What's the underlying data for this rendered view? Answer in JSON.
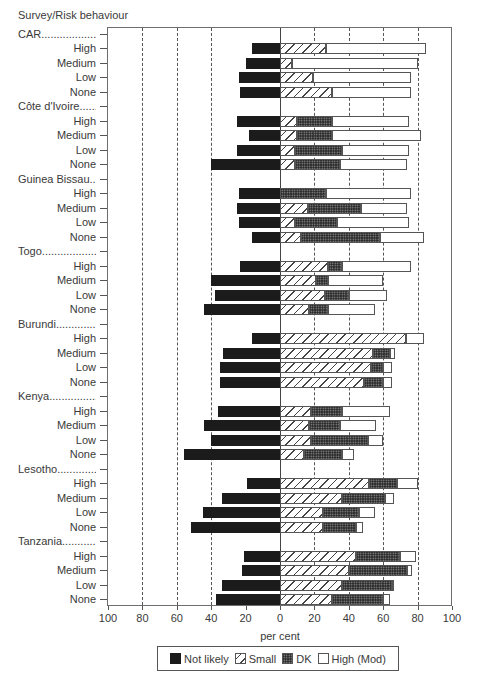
{
  "chart_data": {
    "type": "bar",
    "orientation": "horizontal-diverging-stacked",
    "title": "",
    "ylabel": "Survey/Risk behaviour",
    "xlabel": "per cent",
    "xlim": [
      -100,
      100
    ],
    "x_ticks": [
      "100",
      "80",
      "60",
      "40",
      "20",
      "0",
      "20",
      "40",
      "60",
      "80",
      "100"
    ],
    "grid": "vertical dashed at every 20",
    "legend_position": "bottom",
    "legend": [
      "Not likely",
      "Small",
      "DK",
      "High (Mod)"
    ],
    "note": "Not likely plotted to the left of zero; Small, DK and High (Mod) stacked to the right. Values are cumulative right-end positions converted to segment widths (per cent).",
    "groups": [
      {
        "survey": "CAR",
        "rows": [
          {
            "risk": "High",
            "not_likely": 16,
            "small": 27,
            "dk": 0,
            "high": 58
          },
          {
            "risk": "Medium",
            "not_likely": 20,
            "small": 7,
            "dk": 0,
            "high": 73
          },
          {
            "risk": "Low",
            "not_likely": 24,
            "small": 19,
            "dk": 0,
            "high": 57
          },
          {
            "risk": "None",
            "not_likely": 23,
            "small": 30,
            "dk": 0,
            "high": 46
          }
        ]
      },
      {
        "survey": "Côte d'Ivoire",
        "rows": [
          {
            "risk": "High",
            "not_likely": 25,
            "small": 10,
            "dk": 20,
            "high": 45
          },
          {
            "risk": "Medium",
            "not_likely": 18,
            "small": 10,
            "dk": 20,
            "high": 52
          },
          {
            "risk": "Low",
            "not_likely": 25,
            "small": 9,
            "dk": 27,
            "high": 39
          },
          {
            "risk": "None",
            "not_likely": 40,
            "small": 9,
            "dk": 26,
            "high": 39
          }
        ]
      },
      {
        "survey": "Guinea Bissau",
        "rows": [
          {
            "risk": "High",
            "not_likely": 24,
            "small": 0,
            "dk": 27,
            "high": 49
          },
          {
            "risk": "Medium",
            "not_likely": 25,
            "small": 16,
            "dk": 31,
            "high": 27
          },
          {
            "risk": "Low",
            "not_likely": 24,
            "small": 9,
            "dk": 24,
            "high": 42
          },
          {
            "risk": "None",
            "not_likely": 16,
            "small": 12,
            "dk": 46,
            "high": 26
          }
        ]
      },
      {
        "survey": "Togo",
        "rows": [
          {
            "risk": "High",
            "not_likely": 23,
            "small": 28,
            "dk": 8,
            "high": 40
          },
          {
            "risk": "Medium",
            "not_likely": 40,
            "small": 21,
            "dk": 7,
            "high": 32
          },
          {
            "risk": "Low",
            "not_likely": 38,
            "small": 26,
            "dk": 14,
            "high": 22
          },
          {
            "risk": "None",
            "not_likely": 44,
            "small": 17,
            "dk": 11,
            "high": 27
          }
        ]
      },
      {
        "survey": "Burundi",
        "rows": [
          {
            "risk": "High",
            "not_likely": 16,
            "small": 73,
            "dk": 0,
            "high": 11
          },
          {
            "risk": "Medium",
            "not_likely": 33,
            "small": 54,
            "dk": 10,
            "high": 3
          },
          {
            "risk": "Low",
            "not_likely": 35,
            "small": 53,
            "dk": 7,
            "high": 5
          },
          {
            "risk": "None",
            "not_likely": 35,
            "small": 49,
            "dk": 11,
            "high": 5
          }
        ]
      },
      {
        "survey": "Kenya",
        "rows": [
          {
            "risk": "High",
            "not_likely": 36,
            "small": 18,
            "dk": 18,
            "high": 28
          },
          {
            "risk": "Medium",
            "not_likely": 44,
            "small": 17,
            "dk": 18,
            "high": 21
          },
          {
            "risk": "Low",
            "not_likely": 40,
            "small": 18,
            "dk": 33,
            "high": 9
          },
          {
            "risk": "None",
            "not_likely": 56,
            "small": 14,
            "dk": 22,
            "high": 7
          }
        ]
      },
      {
        "survey": "Lesotho",
        "rows": [
          {
            "risk": "High",
            "not_likely": 19,
            "small": 52,
            "dk": 16,
            "high": 12
          },
          {
            "risk": "Medium",
            "not_likely": 34,
            "small": 36,
            "dk": 25,
            "high": 5
          },
          {
            "risk": "Low",
            "not_likely": 45,
            "small": 25,
            "dk": 21,
            "high": 9
          },
          {
            "risk": "None",
            "not_likely": 52,
            "small": 25,
            "dk": 19,
            "high": 4
          }
        ]
      },
      {
        "survey": "Tanzania",
        "rows": [
          {
            "risk": "High",
            "not_likely": 21,
            "small": 44,
            "dk": 26,
            "high": 9
          },
          {
            "risk": "Medium",
            "not_likely": 22,
            "small": 40,
            "dk": 34,
            "high": 3
          },
          {
            "risk": "Low",
            "not_likely": 34,
            "small": 36,
            "dk": 29,
            "high": 1
          },
          {
            "risk": "None",
            "not_likely": 37,
            "small": 30,
            "dk": 30,
            "high": 4
          }
        ]
      }
    ]
  },
  "labels": {
    "axis_title": "Survey/Risk behaviour",
    "xlabel": "per cent",
    "group_suffix": "......",
    "legend": [
      "Not likely",
      "Small",
      "DK",
      "High (Mod)"
    ]
  }
}
